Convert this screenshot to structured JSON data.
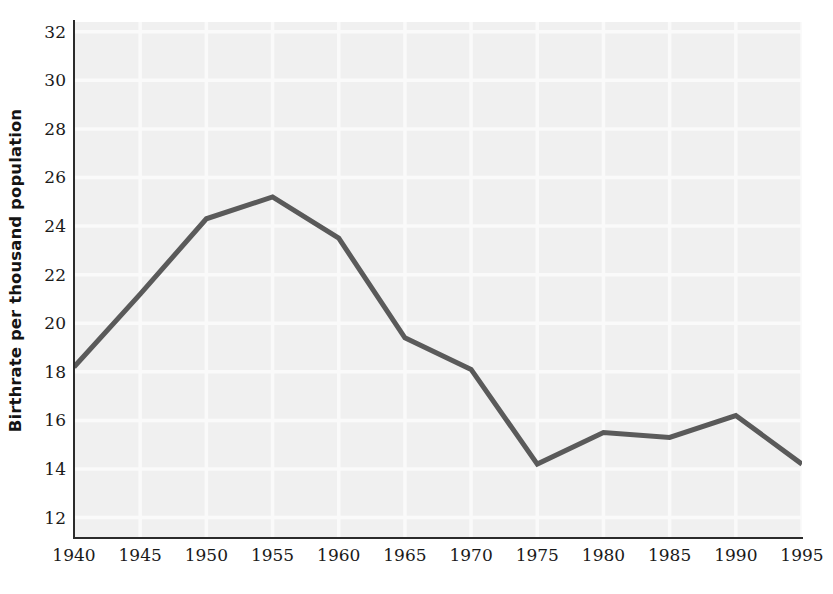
{
  "chart_data": {
    "type": "line",
    "title": "",
    "xlabel": "",
    "ylabel": "Birthrate per thousand population",
    "x": [
      1940,
      1945,
      1950,
      1955,
      1960,
      1965,
      1970,
      1975,
      1980,
      1985,
      1990,
      1995
    ],
    "values": [
      18.2,
      21.2,
      24.3,
      25.2,
      23.5,
      19.4,
      18.1,
      14.2,
      15.5,
      15.3,
      16.2,
      14.2
    ],
    "series": [
      {
        "name": "Birthrate",
        "values": [
          18.2,
          21.2,
          24.3,
          25.2,
          23.5,
          19.4,
          18.1,
          14.2,
          15.5,
          15.3,
          16.2,
          14.2
        ]
      }
    ],
    "x_tick_labels": [
      "1940",
      "1945",
      "1950",
      "1955",
      "1960",
      "1965",
      "1970",
      "1975",
      "1980",
      "1985",
      "1990",
      "1995"
    ],
    "y_tick_labels": [
      "32",
      "30",
      "28",
      "26",
      "24",
      "22",
      "20",
      "18",
      "16",
      "14",
      "12"
    ],
    "y_ticks": [
      32,
      30,
      28,
      26,
      24,
      22,
      20,
      18,
      16,
      14,
      12
    ],
    "xlim": [
      1940,
      1995
    ],
    "ylim": [
      11.2,
      32.4
    ],
    "grid": true,
    "legend": false,
    "legend_position": "none",
    "colors": {
      "line": "#5a5a5a",
      "plot_background": "#f0f0f0",
      "gridline": "#fafafa",
      "axis": "#2b2b2b",
      "text": "#1a1a1a",
      "page_background": "#ffffff"
    },
    "line_width": 5
  }
}
